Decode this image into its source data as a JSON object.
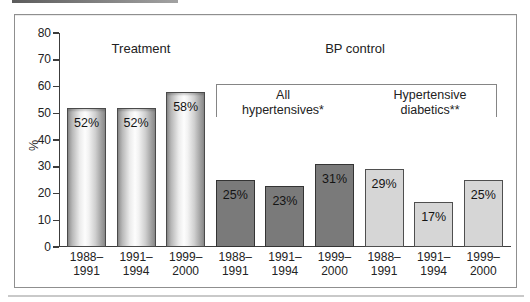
{
  "decor": {
    "top_rule_color": "#5c5c5c",
    "bottom_rule_color": "#c9c9c9",
    "frame_border_color": "#8f8f8f"
  },
  "chart_data": {
    "type": "bar",
    "title": "",
    "ylabel": "%",
    "ylim": [
      0,
      80
    ],
    "yticks": [
      0,
      10,
      20,
      30,
      40,
      50,
      60,
      70,
      80
    ],
    "grid": false,
    "legend_position": "none",
    "group_headers": [
      {
        "label": "Treatment"
      },
      {
        "label": "BP control"
      }
    ],
    "bp_subgroups": [
      {
        "line1": "All",
        "line2": "hypertensives*"
      },
      {
        "line1": "Hypertensive",
        "line2": "diabetics**"
      }
    ],
    "categories": [
      "1988–1991",
      "1991–1994",
      "1999–2000"
    ],
    "series": [
      {
        "name": "Treatment",
        "values": [
          52,
          52,
          58
        ]
      },
      {
        "name": "BP control — All hypertensives*",
        "values": [
          25,
          23,
          31
        ]
      },
      {
        "name": "BP control — Hypertensive diabetics**",
        "values": [
          29,
          17,
          25
        ]
      }
    ],
    "bars": [
      {
        "group": "Treatment",
        "period_line1": "1988–",
        "period_line2": "1991",
        "value": 52,
        "label": "52%",
        "style": "silver"
      },
      {
        "group": "Treatment",
        "period_line1": "1991–",
        "period_line2": "1994",
        "value": 52,
        "label": "52%",
        "style": "silver"
      },
      {
        "group": "Treatment",
        "period_line1": "1999–",
        "period_line2": "2000",
        "value": 58,
        "label": "58%",
        "style": "silver"
      },
      {
        "group": "All hypertensives*",
        "period_line1": "1988–",
        "period_line2": "1991",
        "value": 25,
        "label": "25%",
        "style": "dark"
      },
      {
        "group": "All hypertensives*",
        "period_line1": "1991–",
        "period_line2": "1994",
        "value": 23,
        "label": "23%",
        "style": "dark"
      },
      {
        "group": "All hypertensives*",
        "period_line1": "1999–",
        "period_line2": "2000",
        "value": 31,
        "label": "31%",
        "style": "dark"
      },
      {
        "group": "Hypertensive diabetics**",
        "period_line1": "1988–",
        "period_line2": "1991",
        "value": 29,
        "label": "29%",
        "style": "light"
      },
      {
        "group": "Hypertensive diabetics**",
        "period_line1": "1991–",
        "period_line2": "1994",
        "value": 17,
        "label": "17%",
        "style": "light"
      },
      {
        "group": "Hypertensive diabetics**",
        "period_line1": "1999–",
        "period_line2": "2000",
        "value": 25,
        "label": "25%",
        "style": "light"
      }
    ],
    "colors": {
      "silver_bar_edge": "#8d8d8d",
      "silver_bar_highlight": "#fdfdfd",
      "dark_bar": "#7a7a7a",
      "light_bar": "#d6d6d6",
      "bar_border": "#3f3f3f",
      "axis": "#3c3c3c",
      "bracket": "#858585",
      "text": "#222222"
    }
  }
}
